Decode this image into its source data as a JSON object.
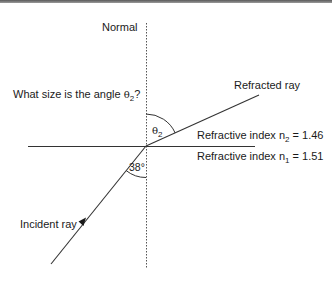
{
  "diagram": {
    "labels": {
      "normal": "Normal",
      "question_prefix": "What size is the angle ",
      "question_symbol": "θ",
      "question_subscript": "2",
      "question_suffix": "?",
      "refracted_ray": "Refracted ray",
      "incident_ray": "Incident ray",
      "angle_refracted_symbol": "θ",
      "angle_refracted_subscript": "2",
      "angle_incident": "38°",
      "medium2_prefix": "Refractive index n",
      "medium2_subscript": "2",
      "medium2_value": " = 1.46",
      "medium1_prefix": "Refractive index n",
      "medium1_subscript": "1",
      "medium1_value": " = 1.51"
    },
    "values": {
      "incident_angle_deg": 38,
      "n1": 1.51,
      "n2": 1.46
    },
    "colors": {
      "line": "#333333",
      "text": "#1a1a1a",
      "top_border": "#6a6a6a"
    }
  }
}
